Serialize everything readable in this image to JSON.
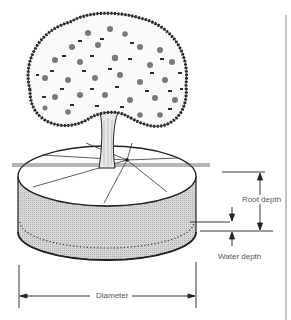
{
  "figure": {
    "labels": {
      "root_depth": "Root depth",
      "water_depth": "Water depth",
      "diameter": "Diameter"
    },
    "colors": {
      "line": "#222222",
      "cylinder_fill": "#cfcfcf",
      "canopy_dark": "#2a2a2a",
      "fruit": "#7a7a7a",
      "label_text": "#555555"
    }
  }
}
